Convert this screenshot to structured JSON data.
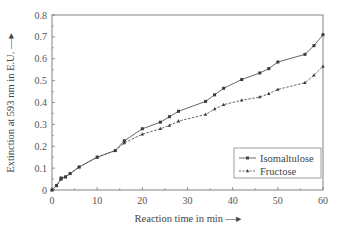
{
  "chart_data": {
    "type": "line",
    "title": "",
    "xlabel": "Reaction time in min",
    "ylabel": "Extinction at 593 nm in E.U.",
    "xlim": [
      0,
      60
    ],
    "ylim": [
      0,
      0.8
    ],
    "x_ticks": [
      0,
      10,
      20,
      30,
      40,
      50,
      60
    ],
    "x_tick_labels": [
      "0",
      "10",
      "20",
      "30",
      "40",
      "50",
      "60"
    ],
    "y_ticks": [
      0,
      0.1,
      0.2,
      0.3,
      0.4,
      0.5,
      0.6,
      0.7,
      0.8
    ],
    "y_tick_labels": [
      "0",
      "0.1",
      "0.2",
      "0.3",
      "0.4",
      "0.5",
      "0.6",
      "0.7",
      "0.8"
    ],
    "grid": false,
    "legend_position": "lower right",
    "series": [
      {
        "name": "Isomaltulose",
        "style": "solid",
        "marker": "square",
        "x": [
          0,
          1,
          2,
          2,
          3,
          4,
          6,
          10,
          14,
          16,
          20,
          24,
          26,
          28,
          34,
          36,
          38,
          42,
          46,
          48,
          50,
          56,
          58,
          60
        ],
        "values": [
          0,
          0.02,
          0.05,
          0.055,
          0.06,
          0.075,
          0.105,
          0.15,
          0.18,
          0.225,
          0.28,
          0.31,
          0.335,
          0.36,
          0.405,
          0.435,
          0.465,
          0.505,
          0.535,
          0.555,
          0.585,
          0.62,
          0.66,
          0.71
        ]
      },
      {
        "name": "Fructose",
        "style": "dashed",
        "marker": "triangle",
        "x": [
          0,
          1,
          2,
          3,
          4,
          6,
          10,
          14,
          16,
          20,
          24,
          26,
          28,
          34,
          36,
          38,
          42,
          46,
          48,
          50,
          56,
          58,
          60
        ],
        "values": [
          0,
          0.02,
          0.05,
          0.06,
          0.075,
          0.105,
          0.15,
          0.18,
          0.215,
          0.255,
          0.28,
          0.295,
          0.315,
          0.345,
          0.37,
          0.39,
          0.41,
          0.425,
          0.44,
          0.46,
          0.49,
          0.525,
          0.565
        ]
      }
    ]
  },
  "labels": {
    "xlabel_text": "Reaction time in min",
    "ylabel_text": "Extinction at 593 nm in E.U.",
    "arrow": "→"
  },
  "legend": {
    "items": [
      {
        "label": "Isomaltulose"
      },
      {
        "label": "Fructose"
      }
    ]
  },
  "colors": {
    "line": "#555555",
    "axis": "#777777",
    "text": "#444444",
    "background": "#ffffff"
  }
}
